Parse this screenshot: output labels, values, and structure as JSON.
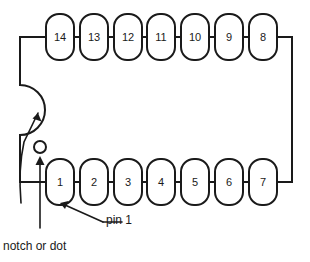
{
  "diagram": {
    "package_type": "14-pin DIP",
    "colors": {
      "stroke": "#1a1a1a",
      "fill": "#ffffff",
      "background": "#ffffff"
    },
    "body": {
      "left": 20,
      "top": 37,
      "right": 292,
      "bottom": 182
    },
    "pins_top": [
      {
        "number": "14",
        "cx": 60
      },
      {
        "number": "13",
        "cx": 94
      },
      {
        "number": "12",
        "cx": 128
      },
      {
        "number": "11",
        "cx": 161
      },
      {
        "number": "10",
        "cx": 195
      },
      {
        "number": "9",
        "cx": 229
      },
      {
        "number": "8",
        "cx": 263
      }
    ],
    "pins_bottom": [
      {
        "number": "1",
        "cx": 60
      },
      {
        "number": "2",
        "cx": 94
      },
      {
        "number": "3",
        "cx": 128
      },
      {
        "number": "4",
        "cx": 161
      },
      {
        "number": "5",
        "cx": 195
      },
      {
        "number": "6",
        "cx": 229
      },
      {
        "number": "7",
        "cx": 263
      }
    ],
    "marker": {
      "dot_cx": 40,
      "dot_cy": 147,
      "dot_r": 6,
      "notch_label": "notch",
      "dot_label": "dot"
    },
    "labels": {
      "notch_or_dot": "notch or dot",
      "pin_1": "pin 1"
    },
    "icons": {
      "notch_arrow": "arrow-up-right-icon",
      "dot_arrow": "arrow-up-icon",
      "pin1_arrow": "arrow-up-left-icon"
    }
  }
}
